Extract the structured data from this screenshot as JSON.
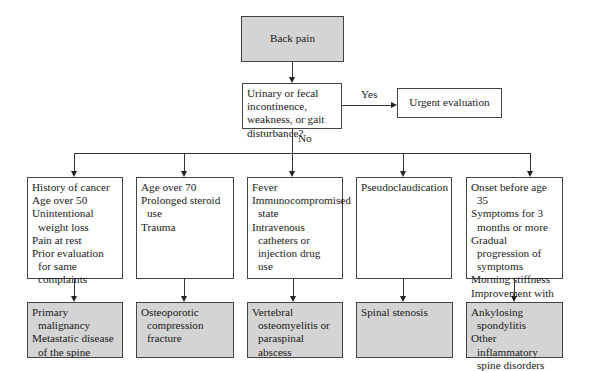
{
  "start": {
    "label": "Back pain"
  },
  "decision": {
    "question": "Urinary or fecal incontinence, weakness, or gait disturbance?",
    "yes_label": "Yes",
    "no_label": "No"
  },
  "urgent": {
    "label": "Urgent evaluation"
  },
  "columns": [
    {
      "criteria": [
        "History of cancer",
        "Age over 50",
        "Unintentional weight loss",
        "Pain at rest",
        "Prior evaluation for same complaints"
      ],
      "diagnoses": [
        "Primary malignancy",
        "Metastatic disease of the spine"
      ]
    },
    {
      "criteria": [
        "Age over 70",
        "Prolonged steroid use",
        "Trauma"
      ],
      "diagnoses": [
        "Osteoporotic compression fracture"
      ]
    },
    {
      "criteria": [
        "Fever",
        "Immunocompromised state",
        "Intravenous catheters or injection drug use"
      ],
      "diagnoses": [
        "Vertebral osteomyelitis or paraspinal abscess"
      ]
    },
    {
      "criteria": [
        "Pseudoclaudication"
      ],
      "diagnoses": [
        "Spinal stenosis"
      ]
    },
    {
      "criteria": [
        "Onset before age 35",
        "Symptoms for 3 months or more",
        "Gradual progression of symptoms",
        "Morning stiffness",
        "Improvement with exercise"
      ],
      "diagnoses": [
        "Ankylosing spondylitis",
        "Other inflammatory spine disorders"
      ]
    }
  ],
  "colors": {
    "terminal_fill": "#d4d4d4",
    "border": "#444444",
    "background": "#ffffff"
  }
}
